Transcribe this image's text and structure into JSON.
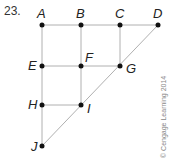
{
  "problem_number": "23.",
  "copyright": "© Cengage Learning 2014",
  "colors": {
    "edge": "#b0b0b0",
    "vertex": "#111111",
    "label": "#222222"
  },
  "vertices": [
    {
      "id": "A",
      "x": 42,
      "y": 25
    },
    {
      "id": "B",
      "x": 81,
      "y": 25
    },
    {
      "id": "C",
      "x": 120,
      "y": 25
    },
    {
      "id": "D",
      "x": 158,
      "y": 25
    },
    {
      "id": "E",
      "x": 42,
      "y": 66
    },
    {
      "id": "F",
      "x": 81,
      "y": 66
    },
    {
      "id": "G",
      "x": 120,
      "y": 66
    },
    {
      "id": "H",
      "x": 42,
      "y": 105
    },
    {
      "id": "I",
      "x": 81,
      "y": 105
    },
    {
      "id": "J",
      "x": 42,
      "y": 146
    }
  ],
  "edges": [
    [
      "A",
      "B"
    ],
    [
      "B",
      "C"
    ],
    [
      "C",
      "D"
    ],
    [
      "E",
      "F"
    ],
    [
      "F",
      "G"
    ],
    [
      "H",
      "I"
    ],
    [
      "A",
      "E"
    ],
    [
      "E",
      "H"
    ],
    [
      "H",
      "J"
    ],
    [
      "B",
      "F"
    ],
    [
      "F",
      "I"
    ],
    [
      "C",
      "G"
    ],
    [
      "J",
      "I"
    ],
    [
      "I",
      "G"
    ],
    [
      "G",
      "D"
    ]
  ],
  "labels": {
    "A": "A",
    "B": "B",
    "C": "C",
    "D": "D",
    "E": "E",
    "F": "F",
    "G": "G",
    "H": "H",
    "I": "I",
    "J": "J"
  }
}
